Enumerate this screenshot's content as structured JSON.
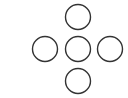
{
  "diagram": {
    "layout": "plus-cross",
    "stroke_color": "#333333",
    "fill_color": "#ffffff",
    "stroke_width": 1.4,
    "radius": 12.5,
    "nodes": [
      {
        "id": "top",
        "cx": 78,
        "cy": 17
      },
      {
        "id": "left",
        "cx": 45,
        "cy": 49
      },
      {
        "id": "center",
        "cx": 78,
        "cy": 49
      },
      {
        "id": "right",
        "cx": 110,
        "cy": 49
      },
      {
        "id": "bottom",
        "cx": 78,
        "cy": 81
      }
    ]
  }
}
